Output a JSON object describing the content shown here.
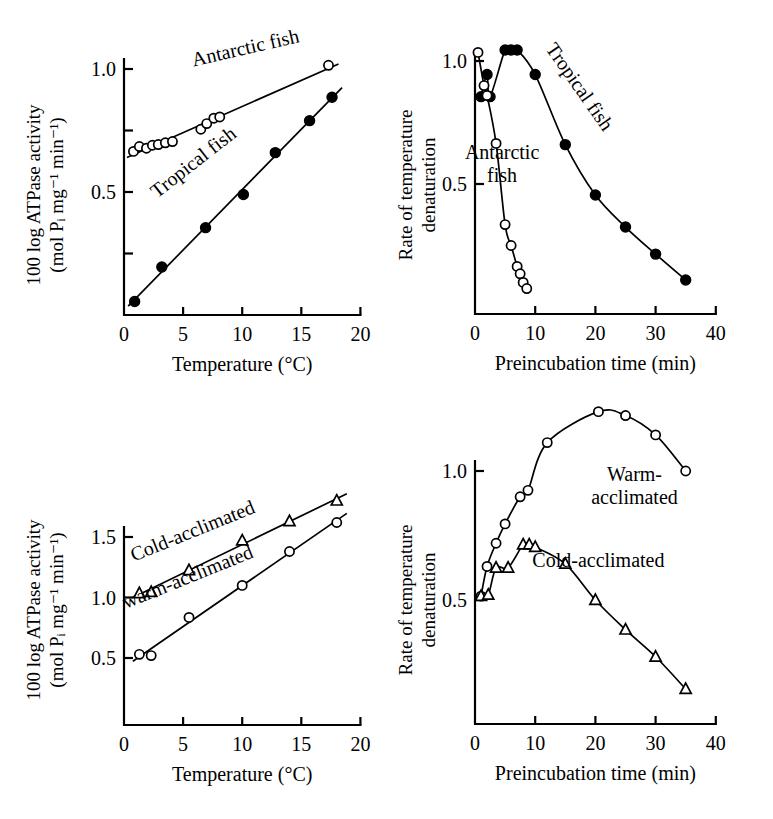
{
  "figure": {
    "background": "#ffffff",
    "ink_color": "#000000",
    "panel_count": 4
  },
  "chart_data": [
    {
      "id": "top-left",
      "type": "scatter",
      "title": "",
      "xlabel": "Temperature (°C)",
      "ylabel": "100 log ATPase activity",
      "ylabel_line2": "(mol Pᵢ mg⁻¹ min⁻¹)",
      "ylabel_plain": "100 log ATPase activity (mol Pi mg-1 min-1)",
      "xlim": [
        0,
        20
      ],
      "ylim": [
        0,
        1.1
      ],
      "xticks": [
        0,
        5,
        10,
        15,
        20
      ],
      "xticklabels": [
        "0",
        "5",
        "10",
        "15",
        "20"
      ],
      "yticks": [
        0.25,
        0.5,
        0.75,
        1.0
      ],
      "yticklabels": [
        "",
        "0.5",
        "",
        "1.0"
      ],
      "grid": false,
      "legend_position": "inline-annotation",
      "series": [
        {
          "name": "Antarctic fish",
          "marker": "open-circle",
          "fit": "line",
          "label_x": 10.4,
          "label_y": 1.06,
          "label_rotation": -13,
          "x": [
            0.8,
            1.3,
            1.9,
            2.4,
            2.9,
            3.5,
            4.1,
            6.5,
            7.0,
            7.6,
            8.1,
            17.3
          ],
          "y": [
            0.665,
            0.685,
            0.678,
            0.69,
            0.693,
            0.7,
            0.705,
            0.755,
            0.778,
            0.8,
            0.805,
            1.015
          ]
        },
        {
          "name": "Tropical fish",
          "marker": "filled-circle",
          "fit": "line",
          "label_x": 6.2,
          "label_y": 0.6,
          "label_rotation": -38,
          "x": [
            0.9,
            3.2,
            6.9,
            10.1,
            12.8,
            15.7,
            17.6
          ],
          "y": [
            0.055,
            0.195,
            0.355,
            0.49,
            0.66,
            0.79,
            0.885
          ]
        }
      ]
    },
    {
      "id": "top-right",
      "type": "line",
      "title": "",
      "xlabel": "Preincubation time (min)",
      "ylabel": "Rate of temperature",
      "ylabel_line2": "denaturation",
      "ylabel_plain": "Rate of temperature denaturation",
      "xlim": [
        0,
        40
      ],
      "ylim": [
        0,
        1.1
      ],
      "xticks": [
        0,
        10,
        20,
        30,
        40
      ],
      "xticklabels": [
        "0",
        "10",
        "20",
        "30",
        "40"
      ],
      "yticks": [
        0.5,
        1.0
      ],
      "yticklabels": [
        "0.5",
        "1.0"
      ],
      "grid": false,
      "legend_position": "inline-annotation",
      "series": [
        {
          "name": "Tropical fish",
          "marker": "filled-circle",
          "label_x": 16.5,
          "label_y": 0.88,
          "label_rotation": 55,
          "x": [
            1.0,
            2.0,
            2.5,
            5.0,
            6.0,
            7.0,
            10.0,
            15.0,
            20.0,
            25.0,
            30.0,
            35.0
          ],
          "y": [
            0.855,
            0.945,
            0.855,
            1.045,
            1.045,
            1.045,
            0.945,
            0.66,
            0.455,
            0.325,
            0.215,
            0.11
          ]
        },
        {
          "name": "Antarctic fish",
          "marker": "open-circle",
          "label_text_line1": "Antarctic",
          "label_text_line2": "fish",
          "label_x": 4.5,
          "label_y": 0.6,
          "label_rotation": 0,
          "x": [
            0.5,
            1.5,
            2.0,
            3.5,
            5.0,
            6.0,
            7.0,
            7.5,
            8.0,
            8.6
          ],
          "y": [
            1.035,
            0.9,
            0.86,
            0.665,
            0.335,
            0.25,
            0.165,
            0.135,
            0.1,
            0.075
          ]
        }
      ]
    },
    {
      "id": "bottom-left",
      "type": "scatter",
      "title": "",
      "xlabel": "Temperature (°C)",
      "ylabel": "100 log ATPase activity",
      "ylabel_line2": "(mol Pᵢ mg⁻¹ min⁻¹)",
      "ylabel_plain": "100 log ATPase activity (mol Pi mg-1 min-1)",
      "xlim": [
        0,
        20
      ],
      "ylim": [
        0.1,
        1.95
      ],
      "xticks": [
        0,
        5,
        10,
        15,
        20
      ],
      "xticklabels": [
        "0",
        "5",
        "10",
        "15",
        "20"
      ],
      "yticks": [
        0.5,
        1.0,
        1.5
      ],
      "yticklabels": [
        "0.5",
        "1.0",
        "1.5"
      ],
      "grid": false,
      "legend_position": "inline-annotation",
      "series": [
        {
          "name": "Cold-acclimated",
          "marker": "triangle",
          "fit": "line",
          "label_x": 6.0,
          "label_y": 1.5,
          "label_rotation": -22,
          "x": [
            1.3,
            2.3,
            5.5,
            10.0,
            14.0,
            18.0
          ],
          "y": [
            1.035,
            1.045,
            1.225,
            1.47,
            1.63,
            1.8
          ]
        },
        {
          "name": "warm-acclimated",
          "marker": "open-circle",
          "fit": "line",
          "label_x": 5.6,
          "label_y": 1.12,
          "label_rotation": -22,
          "x": [
            1.3,
            2.3,
            5.5,
            10.0,
            14.0,
            18.0
          ],
          "y": [
            0.53,
            0.52,
            0.835,
            1.1,
            1.38,
            1.62
          ]
        }
      ]
    },
    {
      "id": "bottom-right",
      "type": "line",
      "title": "",
      "xlabel": "Preincubation time (min)",
      "ylabel": "Rate of temperature",
      "ylabel_line2": "denaturation",
      "ylabel_plain": "Rate of temperature denaturation",
      "xlim": [
        0,
        40
      ],
      "ylim": [
        0.1,
        1.3
      ],
      "xticks": [
        0,
        10,
        20,
        30,
        40
      ],
      "xticklabels": [
        "0",
        "10",
        "20",
        "30",
        "40"
      ],
      "yticks": [
        0.5,
        1.0
      ],
      "yticklabels": [
        "0.5",
        "1.0"
      ],
      "grid": false,
      "legend_position": "inline-annotation",
      "series": [
        {
          "name": "Warm-acclimated",
          "marker": "open-circle",
          "label_text_line1": "Warm-",
          "label_text_line2": "acclimated",
          "label_x": 26.5,
          "label_y": 0.96,
          "label_rotation": 0,
          "x": [
            1.0,
            2.0,
            3.5,
            5.0,
            7.5,
            8.8,
            12.0,
            20.5,
            25.0,
            30.0,
            35.0
          ],
          "y": [
            0.515,
            0.63,
            0.72,
            0.795,
            0.9,
            0.925,
            1.11,
            1.23,
            1.215,
            1.14,
            1.0
          ]
        },
        {
          "name": "Cold-acclimated",
          "marker": "triangle",
          "label_text_line1": "Cold-acclimated",
          "label_x": 20.5,
          "label_y": 0.63,
          "label_rotation": 0,
          "x": [
            1.0,
            2.2,
            3.5,
            5.5,
            8.0,
            9.0,
            10.0,
            15.0,
            20.0,
            25.0,
            30.0,
            35.0
          ],
          "y": [
            0.515,
            0.52,
            0.625,
            0.625,
            0.715,
            0.715,
            0.705,
            0.64,
            0.5,
            0.385,
            0.28,
            0.155
          ]
        }
      ]
    }
  ]
}
